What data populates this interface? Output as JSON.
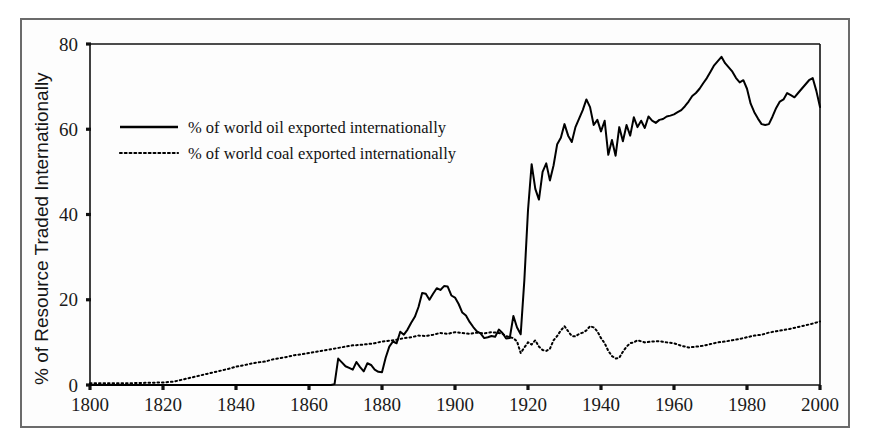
{
  "chart_data": {
    "type": "line",
    "title": "",
    "xlabel": "",
    "ylabel": "% of Resource Traded Internationally",
    "xlim": [
      1800,
      2000
    ],
    "ylim": [
      0,
      80
    ],
    "xticks": [
      1800,
      1820,
      1840,
      1860,
      1880,
      1900,
      1920,
      1940,
      1960,
      1980,
      2000
    ],
    "yticks": [
      0,
      20,
      40,
      60,
      80
    ],
    "grid": false,
    "legend_position": "upper-left-inside",
    "series": [
      {
        "name": "% of world oil exported internationally",
        "style": "solid",
        "color": "#000000",
        "x": [
          1800,
          1820,
          1840,
          1855,
          1860,
          1864,
          1866,
          1867,
          1868,
          1869,
          1870,
          1871,
          1872,
          1873,
          1874,
          1875,
          1876,
          1877,
          1878,
          1879,
          1880,
          1881,
          1882,
          1883,
          1884,
          1885,
          1886,
          1887,
          1888,
          1889,
          1890,
          1891,
          1892,
          1893,
          1894,
          1895,
          1896,
          1897,
          1898,
          1899,
          1900,
          1901,
          1902,
          1903,
          1904,
          1905,
          1906,
          1907,
          1908,
          1909,
          1910,
          1911,
          1912,
          1913,
          1914,
          1915,
          1916,
          1917,
          1918,
          1919,
          1920,
          1921,
          1922,
          1923,
          1924,
          1925,
          1926,
          1927,
          1928,
          1929,
          1930,
          1931,
          1932,
          1933,
          1934,
          1935,
          1936,
          1937,
          1938,
          1939,
          1940,
          1941,
          1942,
          1943,
          1944,
          1945,
          1946,
          1947,
          1948,
          1949,
          1950,
          1951,
          1952,
          1953,
          1954,
          1955,
          1956,
          1957,
          1958,
          1959,
          1960,
          1961,
          1962,
          1963,
          1964,
          1965,
          1966,
          1967,
          1968,
          1969,
          1970,
          1971,
          1972,
          1973,
          1974,
          1975,
          1976,
          1977,
          1978,
          1979,
          1980,
          1981,
          1982,
          1983,
          1984,
          1985,
          1986,
          1987,
          1988,
          1989,
          1990,
          1991,
          1992,
          1993,
          1994,
          1995,
          1996,
          1997,
          1998,
          1999,
          2000
        ],
        "y": [
          0,
          0,
          0,
          0,
          0,
          0,
          0,
          0.2,
          6.2,
          5.3,
          4.4,
          4.0,
          3.6,
          5.4,
          4.2,
          3.2,
          5.1,
          4.7,
          3.6,
          3.1,
          3.0,
          6.4,
          9.0,
          10.2,
          9.8,
          12.5,
          11.8,
          13.0,
          14.6,
          16.0,
          18.3,
          21.6,
          21.4,
          20.0,
          21.4,
          22.7,
          22.3,
          23.2,
          23.1,
          21.0,
          20.5,
          19.0,
          17.0,
          16.3,
          14.8,
          13.6,
          12.6,
          12.1,
          11.0,
          11.2,
          11.5,
          11.3,
          13.0,
          12.2,
          10.9,
          11.0,
          16.2,
          13.5,
          11.9,
          24.6,
          41.0,
          51.8,
          46.0,
          43.5,
          50.0,
          52.0,
          48.0,
          51.5,
          56.5,
          58.0,
          61.2,
          58.5,
          57.0,
          60.5,
          62.5,
          64.5,
          67.0,
          65.2,
          61.0,
          62.2,
          59.5,
          62.0,
          54.0,
          57.5,
          53.8,
          60.5,
          57.2,
          61.0,
          58.5,
          62.8,
          60.5,
          62.0,
          60.3,
          63.0,
          62.0,
          61.5,
          62.2,
          62.4,
          63.0,
          63.2,
          63.5,
          64.0,
          64.5,
          65.4,
          66.5,
          67.8,
          68.5,
          69.5,
          70.8,
          72.0,
          73.5,
          75.0,
          76.0,
          77.0,
          75.5,
          74.5,
          73.5,
          72.0,
          71.0,
          71.5,
          69.5,
          66.0,
          64.0,
          62.5,
          61.2,
          61.0,
          61.2,
          63.0,
          65.0,
          66.5,
          67.0,
          68.5,
          68.0,
          67.5,
          68.5,
          69.5,
          70.5,
          71.5,
          72.0,
          69.0,
          65.2
        ]
      },
      {
        "name": "% of world coal exported internationally",
        "style": "dotted",
        "color": "#000000",
        "x": [
          1800,
          1805,
          1810,
          1815,
          1820,
          1823,
          1825,
          1827,
          1830,
          1832,
          1834,
          1836,
          1838,
          1840,
          1842,
          1844,
          1846,
          1848,
          1850,
          1852,
          1854,
          1856,
          1858,
          1860,
          1862,
          1864,
          1866,
          1868,
          1870,
          1872,
          1874,
          1876,
          1878,
          1880,
          1882,
          1884,
          1886,
          1888,
          1890,
          1892,
          1894,
          1896,
          1898,
          1900,
          1902,
          1904,
          1906,
          1908,
          1910,
          1912,
          1913,
          1914,
          1915,
          1916,
          1917,
          1918,
          1919,
          1920,
          1921,
          1922,
          1923,
          1924,
          1925,
          1926,
          1927,
          1928,
          1929,
          1930,
          1931,
          1932,
          1933,
          1934,
          1935,
          1936,
          1937,
          1938,
          1939,
          1940,
          1941,
          1942,
          1943,
          1944,
          1945,
          1946,
          1947,
          1948,
          1949,
          1950,
          1952,
          1954,
          1956,
          1958,
          1960,
          1962,
          1964,
          1966,
          1968,
          1970,
          1972,
          1974,
          1976,
          1978,
          1980,
          1982,
          1984,
          1986,
          1988,
          1990,
          1992,
          1994,
          1996,
          1998,
          2000
        ],
        "y": [
          0.4,
          0.4,
          0.4,
          0.5,
          0.6,
          0.8,
          1.2,
          1.6,
          2.2,
          2.6,
          3.0,
          3.4,
          3.8,
          4.3,
          4.6,
          5.0,
          5.3,
          5.5,
          6.0,
          6.3,
          6.6,
          7.0,
          7.2,
          7.5,
          7.8,
          8.1,
          8.4,
          8.7,
          9.0,
          9.3,
          9.4,
          9.6,
          9.8,
          10.2,
          10.4,
          10.6,
          11.0,
          11.2,
          11.6,
          11.5,
          11.8,
          12.2,
          12.0,
          12.4,
          12.2,
          12.0,
          12.3,
          12.1,
          12.4,
          12.2,
          12.0,
          11.5,
          11.2,
          11.0,
          10.2,
          7.5,
          8.8,
          10.0,
          9.5,
          10.5,
          9.0,
          8.2,
          8.0,
          8.5,
          10.5,
          11.5,
          12.8,
          13.8,
          12.6,
          11.5,
          11.4,
          12.0,
          12.3,
          12.8,
          13.8,
          13.5,
          12.6,
          11.0,
          9.8,
          8.0,
          6.8,
          6.2,
          6.4,
          7.8,
          9.0,
          9.8,
          10.0,
          10.5,
          10.0,
          10.2,
          10.3,
          10.0,
          9.8,
          9.2,
          8.8,
          9.0,
          9.2,
          9.6,
          10.0,
          10.2,
          10.5,
          10.8,
          11.2,
          11.6,
          11.8,
          12.3,
          12.6,
          12.9,
          13.2,
          13.6,
          14.0,
          14.4,
          14.9
        ]
      }
    ]
  },
  "legend": {
    "items": [
      {
        "label": "% of world oil exported internationally",
        "style": "solid"
      },
      {
        "label": "% of world coal exported internationally",
        "style": "dotted"
      }
    ]
  },
  "axes": {
    "y_title": "% of Resource Traded Internationally",
    "y_tick_labels": [
      "0",
      "20",
      "40",
      "60",
      "80"
    ],
    "x_tick_labels": [
      "1800",
      "1820",
      "1840",
      "1860",
      "1880",
      "1900",
      "1920",
      "1940",
      "1960",
      "1980",
      "2000"
    ]
  }
}
